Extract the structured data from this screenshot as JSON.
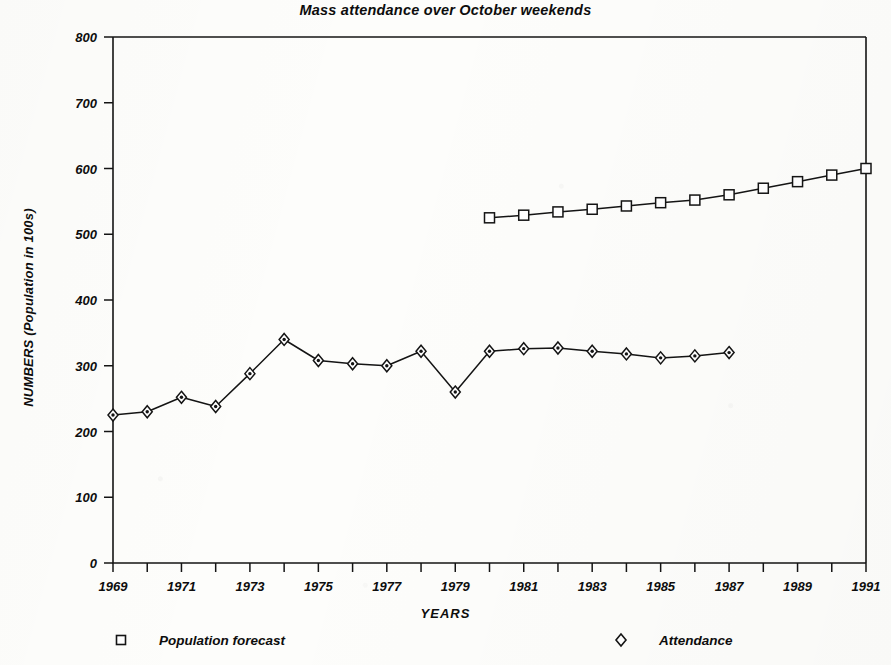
{
  "chart_data": {
    "type": "line",
    "title": "Mass attendance over October weekends",
    "xlabel": "YEARS",
    "ylabel": "NUMBERS (Population in 100s)",
    "xlim": [
      1969,
      1991
    ],
    "ylim": [
      0,
      800
    ],
    "ytick_step": 100,
    "xtick_step": 1,
    "xtick_label_step": 2,
    "grid": false,
    "legend_position": "bottom",
    "yticks": [
      0,
      100,
      200,
      300,
      400,
      500,
      600,
      700,
      800
    ],
    "ytick_labels": [
      "0",
      "100",
      "200",
      "300",
      "400",
      "500",
      "600",
      "700",
      "800"
    ],
    "xticks": [
      1969,
      1970,
      1971,
      1972,
      1973,
      1974,
      1975,
      1976,
      1977,
      1978,
      1979,
      1980,
      1981,
      1982,
      1983,
      1984,
      1985,
      1986,
      1987,
      1988,
      1989,
      1990,
      1991
    ],
    "xtick_labels": [
      "1969",
      "",
      "1971",
      "",
      "1973",
      "",
      "1975",
      "",
      "1977",
      "",
      "1979",
      "",
      "1981",
      "",
      "1983",
      "",
      "1985",
      "",
      "1987",
      "",
      "1989",
      "",
      "1991"
    ],
    "series": [
      {
        "name": "Population forecast",
        "marker": "square",
        "color": "#141414",
        "x": [
          1980,
          1981,
          1982,
          1983,
          1984,
          1985,
          1986,
          1987,
          1988,
          1989,
          1990,
          1991
        ],
        "values": [
          525,
          529,
          534,
          538,
          543,
          548,
          552,
          560,
          570,
          580,
          590,
          600
        ]
      },
      {
        "name": "Attendance",
        "marker": "diamond",
        "color": "#141414",
        "x": [
          1969,
          1970,
          1971,
          1972,
          1973,
          1974,
          1975,
          1976,
          1977,
          1978,
          1979,
          1980,
          1981,
          1982,
          1983,
          1984,
          1985,
          1986,
          1987
        ],
        "values": [
          225,
          230,
          252,
          238,
          288,
          340,
          308,
          303,
          300,
          322,
          260,
          322,
          326,
          327,
          322,
          318,
          312,
          315,
          320
        ]
      }
    ]
  },
  "legend": {
    "forecast_label": "Population forecast",
    "attendance_label": "Attendance"
  }
}
